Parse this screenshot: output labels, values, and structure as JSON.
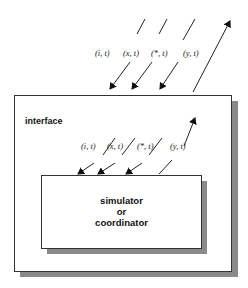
{
  "diagram": {
    "outer_box": {
      "title": "interface"
    },
    "inner_box": {
      "line1": "simulator",
      "line2": "or",
      "line3": "coordinator"
    },
    "external_ports": [
      {
        "label": "(i, t)",
        "direction": "in"
      },
      {
        "label": "(x, t)",
        "direction": "in"
      },
      {
        "label": "(*, t)",
        "direction": "in"
      },
      {
        "label": "(y, t)",
        "direction": "out"
      }
    ],
    "internal_ports": [
      {
        "label": "(i, t)",
        "direction": "in"
      },
      {
        "label": "(x, t)",
        "direction": "in"
      },
      {
        "label": "(*, t)",
        "direction": "in"
      },
      {
        "label": "(y, t)",
        "direction": "out"
      }
    ],
    "colors": {
      "line": "#222222",
      "shadow": "#8a8a8a",
      "box_fill": "#ffffff"
    }
  }
}
